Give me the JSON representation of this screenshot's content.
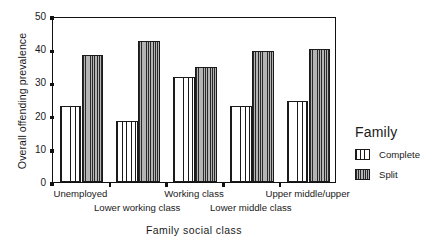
{
  "chart_data": {
    "type": "bar",
    "title": "",
    "xlabel": "Family social class",
    "ylabel": "Overall offending prevalence",
    "ylim": [
      0,
      50
    ],
    "yticks": [
      0,
      10,
      20,
      30,
      40,
      50
    ],
    "grid": false,
    "legend_position": "right",
    "legend_title": "Family",
    "categories": [
      "Unemployed",
      "Lower working class",
      "Working class",
      "Lower middle class",
      "Upper middle/upper"
    ],
    "series": [
      {
        "name": "Complete",
        "values": [
          23,
          18.5,
          31.5,
          23,
          24.5
        ]
      },
      {
        "name": "Split",
        "values": [
          38.3,
          42.6,
          34.6,
          39.6,
          40
        ]
      }
    ]
  },
  "legend": {
    "title": "Family",
    "entries": [
      {
        "label": "Complete"
      },
      {
        "label": "Split"
      }
    ]
  }
}
